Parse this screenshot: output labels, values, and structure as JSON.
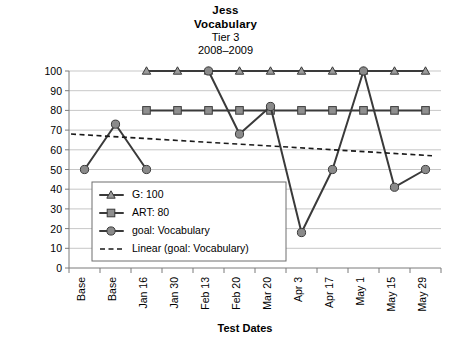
{
  "title": {
    "line1": "Jess",
    "line2": "Vocabulary",
    "line3": "Tier 3",
    "line4": "2008–2009"
  },
  "chart_data": {
    "type": "line",
    "title": "Jess Vocabulary Tier 3 2008–2009",
    "xlabel": "Test Dates",
    "ylabel": "",
    "ylim": [
      0,
      100
    ],
    "ytick_step": 10,
    "grid": true,
    "legend_position": "inside-lower-left",
    "categories": [
      "Base",
      "Base",
      "Jan 16",
      "Jan 30",
      "Feb 13",
      "Feb 20",
      "Mar 20",
      "Apr 3",
      "Apr 17",
      "May 1",
      "May 15",
      "May 29"
    ],
    "yticks": [
      0,
      10,
      20,
      30,
      40,
      50,
      60,
      70,
      80,
      90,
      100
    ],
    "series": [
      {
        "name": "G: 100",
        "marker": "triangle",
        "values": [
          null,
          null,
          100,
          100,
          100,
          100,
          100,
          100,
          100,
          100,
          100,
          100
        ]
      },
      {
        "name": "ART: 80",
        "marker": "square",
        "values": [
          null,
          null,
          80,
          80,
          80,
          80,
          80,
          80,
          80,
          80,
          80,
          80
        ]
      },
      {
        "name": "goal: Vocabulary",
        "marker": "circle",
        "values": [
          50,
          73,
          50,
          null,
          100,
          68,
          82,
          18,
          50,
          100,
          41,
          50
        ]
      },
      {
        "name": "Linear (goal: Vocabulary)",
        "marker": "none",
        "style": "dashed",
        "trend_start": 68,
        "trend_end": 57
      }
    ]
  },
  "legend": {
    "items": [
      {
        "label": "G: 100",
        "marker": "triangle"
      },
      {
        "label": "ART: 80",
        "marker": "square"
      },
      {
        "label": "goal: Vocabulary",
        "marker": "circle"
      },
      {
        "label": "Linear (goal: Vocabulary)",
        "marker": "dashed-line"
      }
    ]
  },
  "axes": {
    "x_title": "Test Dates"
  },
  "colors": {
    "series_line": "#3a3a3a",
    "marker_fill": "#8f8f8f",
    "gridline": "#b9b9b9",
    "background": "#ffffff"
  }
}
